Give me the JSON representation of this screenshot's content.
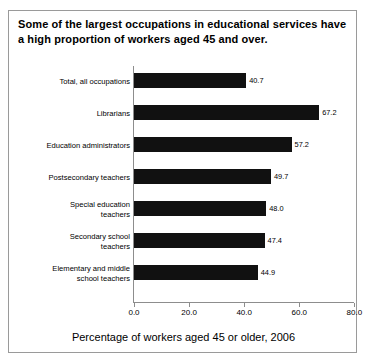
{
  "card": {
    "title_line1": "Some of the largest occupations in educational services",
    "title_line2": "have a high proportion of workers aged 45 and over."
  },
  "chart_data": {
    "type": "bar",
    "orientation": "horizontal",
    "title": "Some of the largest occupations in educational services have a high proportion of workers aged 45 and over.",
    "xlabel": "Percentage of workers aged 45 or older, 2006",
    "ylabel": "",
    "xlim": [
      0,
      80
    ],
    "xticks": [
      "0.0",
      "20.0",
      "40.0",
      "60.0",
      "80.0"
    ],
    "xtick_values": [
      0,
      20,
      40,
      60,
      80
    ],
    "grid": false,
    "legend": "none",
    "bar_color": "#111111",
    "categories": [
      "Total, all occupations",
      "Librarians",
      "Education administrators",
      "Postsecondary teachers",
      "Special education teachers",
      "Secondary school teachers",
      "Elementary and middle school teachers"
    ],
    "category_lines": [
      [
        "Total, all occupations"
      ],
      [
        "Librarians"
      ],
      [
        "Education administrators"
      ],
      [
        "Postsecondary teachers"
      ],
      [
        "Special education",
        "teachers"
      ],
      [
        "Secondary school",
        "teachers"
      ],
      [
        "Elementary and middle",
        "school teachers"
      ]
    ],
    "values": [
      40.7,
      67.2,
      57.2,
      49.7,
      48.0,
      47.4,
      44.9
    ],
    "value_labels": [
      "40.7",
      "67.2",
      "57.2",
      "49.7",
      "48.0",
      "47.4",
      "44.9"
    ]
  }
}
